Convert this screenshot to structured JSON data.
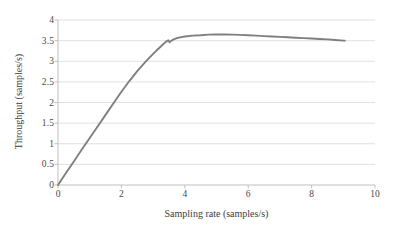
{
  "chart_data": {
    "type": "line",
    "title": "",
    "xlabel": "Sampling rate (samples/s)",
    "ylabel": "Throughput (samples/s)",
    "xlim": [
      0,
      10
    ],
    "ylim": [
      0,
      4
    ],
    "xticks": [
      "0",
      "2",
      "4",
      "6",
      "8",
      "10"
    ],
    "yticks": [
      "0",
      "0.5",
      "1",
      "1.5",
      "2",
      "2.5",
      "3",
      "3.5",
      "4"
    ],
    "xtick_values": [
      0,
      2,
      4,
      6,
      8,
      10
    ],
    "ytick_values": [
      0,
      0.5,
      1,
      1.5,
      2,
      2.5,
      3,
      3.5,
      4
    ],
    "grid": "horizontal",
    "legend": "none",
    "line_color": "#7f7f7f",
    "grid_color": "#d9d9d9",
    "axis_color": "#bfbfbf",
    "background": "#ffffff",
    "series": [
      {
        "name": "throughput",
        "x": [
          0.0,
          0.25,
          0.5,
          0.75,
          1.0,
          1.25,
          1.5,
          1.75,
          2.0,
          2.25,
          2.5,
          2.75,
          3.0,
          3.15,
          3.3,
          3.4,
          3.48,
          3.52,
          3.58,
          3.65,
          3.75,
          3.85,
          4.0,
          4.25,
          4.5,
          4.75,
          5.0,
          5.25,
          5.5,
          5.75,
          6.0,
          6.25,
          6.5,
          6.75,
          7.0,
          7.25,
          7.5,
          7.75,
          8.0,
          8.25,
          8.5,
          8.75,
          9.0,
          9.05
        ],
        "y": [
          0.0,
          0.29,
          0.57,
          0.86,
          1.14,
          1.42,
          1.7,
          1.98,
          2.26,
          2.52,
          2.76,
          2.98,
          3.18,
          3.29,
          3.4,
          3.47,
          3.51,
          3.46,
          3.5,
          3.53,
          3.56,
          3.58,
          3.6,
          3.62,
          3.63,
          3.645,
          3.65,
          3.65,
          3.645,
          3.64,
          3.63,
          3.62,
          3.61,
          3.6,
          3.59,
          3.58,
          3.57,
          3.56,
          3.55,
          3.54,
          3.53,
          3.515,
          3.5,
          3.5
        ]
      }
    ]
  },
  "axes": {
    "ylabel_text": "Throughput (samples/s)",
    "xlabel_text": "Sampling rate (samples/s)"
  }
}
